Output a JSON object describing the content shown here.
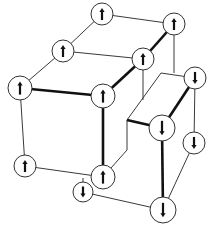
{
  "diagram": {
    "title": "",
    "colors": {
      "background": "#ffffff",
      "line": "#333333",
      "thick_line": "#111111",
      "node_fill": "#ffffff"
    },
    "nodes": [
      {
        "id": "n1",
        "x": 102,
        "y": 14,
        "r": 11,
        "spin": "up"
      },
      {
        "id": "n2",
        "x": 174,
        "y": 24,
        "r": 11,
        "spin": "up"
      },
      {
        "id": "n3",
        "x": 63,
        "y": 51,
        "r": 11,
        "spin": "up"
      },
      {
        "id": "n4",
        "x": 143,
        "y": 59,
        "r": 11,
        "spin": "up"
      },
      {
        "id": "n5",
        "x": 20,
        "y": 88,
        "r": 12,
        "spin": "up"
      },
      {
        "id": "n6",
        "x": 103,
        "y": 96,
        "r": 12,
        "spin": "up"
      },
      {
        "id": "n7",
        "x": 195,
        "y": 78,
        "r": 11,
        "spin": "down"
      },
      {
        "id": "n8",
        "x": 162,
        "y": 128,
        "r": 13,
        "spin": "down"
      },
      {
        "id": "n9",
        "x": 194,
        "y": 143,
        "r": 11,
        "spin": "down"
      },
      {
        "id": "n10",
        "x": 25,
        "y": 166,
        "r": 11,
        "spin": "up"
      },
      {
        "id": "n11",
        "x": 103,
        "y": 177,
        "r": 12,
        "spin": "up"
      },
      {
        "id": "n12",
        "x": 83,
        "y": 192,
        "r": 10,
        "spin": "down"
      },
      {
        "id": "n13",
        "x": 163,
        "y": 210,
        "r": 13,
        "spin": "down"
      }
    ],
    "thin_edges": [
      {
        "x1": 102,
        "y1": 14,
        "x2": 174,
        "y2": 24
      },
      {
        "x1": 102,
        "y1": 14,
        "x2": 63,
        "y2": 51
      },
      {
        "x1": 63,
        "y1": 51,
        "x2": 143,
        "y2": 59
      },
      {
        "x1": 63,
        "y1": 51,
        "x2": 20,
        "y2": 88
      },
      {
        "x1": 20,
        "y1": 88,
        "x2": 25,
        "y2": 166
      },
      {
        "x1": 25,
        "y1": 166,
        "x2": 103,
        "y2": 177
      },
      {
        "x1": 83,
        "y1": 178,
        "x2": 83,
        "y2": 192
      },
      {
        "x1": 83,
        "y1": 192,
        "x2": 163,
        "y2": 210
      },
      {
        "x1": 143,
        "y1": 59,
        "x2": 143,
        "y2": 100
      },
      {
        "x1": 127,
        "y1": 120,
        "x2": 161,
        "y2": 73
      },
      {
        "x1": 161,
        "y1": 73,
        "x2": 195,
        "y2": 78
      },
      {
        "x1": 127,
        "y1": 120,
        "x2": 127,
        "y2": 150
      },
      {
        "x1": 127,
        "y1": 150,
        "x2": 103,
        "y2": 177
      },
      {
        "x1": 195,
        "y1": 78,
        "x2": 194,
        "y2": 143
      },
      {
        "x1": 194,
        "y1": 143,
        "x2": 163,
        "y2": 210
      }
    ],
    "inferred_thin_edges": [
      {
        "x1": 174,
        "y1": 24,
        "x2": 174,
        "y2": 73,
        "note": "vertical from n2; end point near step corner not verified"
      }
    ],
    "thick_edges": [
      {
        "x1": 20,
        "y1": 88,
        "x2": 103,
        "y2": 96
      },
      {
        "x1": 103,
        "y1": 96,
        "x2": 143,
        "y2": 59
      },
      {
        "x1": 143,
        "y1": 59,
        "x2": 174,
        "y2": 24
      },
      {
        "x1": 103,
        "y1": 96,
        "x2": 103,
        "y2": 177
      },
      {
        "x1": 127,
        "y1": 120,
        "x2": 162,
        "y2": 128
      },
      {
        "x1": 195,
        "y1": 78,
        "x2": 162,
        "y2": 128
      },
      {
        "x1": 162,
        "y1": 128,
        "x2": 163,
        "y2": 210
      }
    ],
    "spin_counts": {
      "up": 8,
      "down": 5
    }
  }
}
